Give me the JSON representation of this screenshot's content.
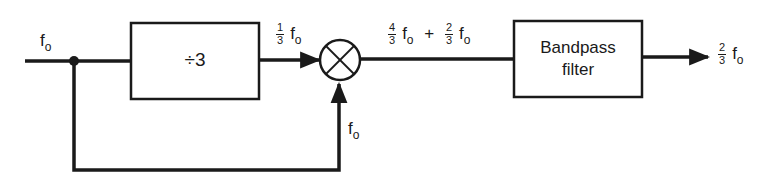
{
  "diagram": {
    "input": {
      "label": "f",
      "subscript": "o"
    },
    "divider_block": {
      "label": "÷3"
    },
    "divider_output": {
      "num": "1",
      "den": "3",
      "label": "f",
      "subscript": "o"
    },
    "mixer": {
      "symbol": "multiplier-circle-x"
    },
    "feedback": {
      "label": "f",
      "subscript": "o"
    },
    "mixer_output": {
      "term1": {
        "num": "4",
        "den": "3",
        "label": "f",
        "subscript": "o"
      },
      "operator": "+",
      "term2": {
        "num": "2",
        "den": "3",
        "label": "f",
        "subscript": "o"
      }
    },
    "filter_block": {
      "line1": "Bandpass",
      "line2": "filter"
    },
    "output": {
      "num": "2",
      "den": "3",
      "label": "f",
      "subscript": "o"
    }
  },
  "colors": {
    "stroke": "#1a1a1a",
    "background": "#ffffff"
  }
}
